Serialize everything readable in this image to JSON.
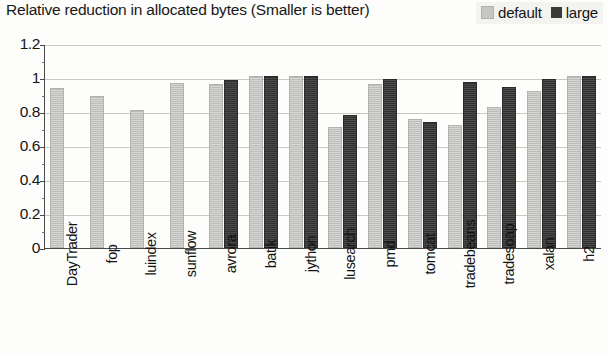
{
  "chart_data": {
    "type": "bar",
    "title": "Relative reduction in allocated bytes (Smaller is better)",
    "xlabel": "",
    "ylabel": "",
    "ylim": [
      0,
      1.2
    ],
    "yticks": [
      "0",
      "0.2",
      "0.4",
      "0.6",
      "0.8",
      "1",
      "1.2"
    ],
    "ytick_values": [
      0,
      0.2,
      0.4,
      0.6,
      0.8,
      1.0,
      1.2
    ],
    "grid": true,
    "legend_position": "top-right",
    "categories": [
      "DayTrader",
      "fop",
      "luindex",
      "sunflow",
      "avrora",
      "batik",
      "jython",
      "lusearch",
      "pmd",
      "tomcat",
      "tradebeans",
      "tradesoap",
      "xalan",
      "h2"
    ],
    "series": [
      {
        "name": "default",
        "color": "#c6c6c4",
        "values": [
          0.93,
          0.88,
          0.8,
          0.96,
          0.955,
          1.0,
          1.0,
          0.7,
          0.955,
          0.75,
          0.71,
          0.82,
          0.91,
          1.0
        ]
      },
      {
        "name": "large",
        "color": "#3a3a3a",
        "values": [
          null,
          null,
          null,
          null,
          0.975,
          1.0,
          1.0,
          0.77,
          0.985,
          0.73,
          0.965,
          0.935,
          0.98,
          1.0
        ]
      }
    ]
  },
  "legend": {
    "items": [
      {
        "label": "default",
        "color": "#c6c6c4"
      },
      {
        "label": "large",
        "color": "#3a3a3a"
      }
    ]
  }
}
